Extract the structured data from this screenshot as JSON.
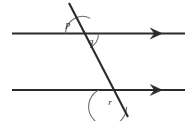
{
  "figure": {
    "background_color": "#ffffff",
    "line_color": "#2b2b2b",
    "arc_color": "#6b6b63",
    "label_color": "#1a1a1a",
    "width": 194,
    "height": 121
  },
  "lines": [
    {
      "name": "upper-parallel-line",
      "x1": 12,
      "y1": 33.5,
      "x2": 185,
      "y2": 33.5,
      "arrow": "right",
      "arrow_x": 162,
      "stroke_width": 2.1
    },
    {
      "name": "lower-parallel-line",
      "x1": 12,
      "y1": 90,
      "x2": 185,
      "y2": 90,
      "arrow": "right",
      "arrow_x": 162,
      "stroke_width": 2.1
    },
    {
      "name": "transversal-line",
      "x1": 69,
      "y1": 3,
      "x2": 128,
      "y2": 117,
      "arrow": "none",
      "stroke_width": 2.1
    }
  ],
  "intersections": [
    {
      "name": "upper-intersection",
      "x": 82.5,
      "y": 33.5
    },
    {
      "name": "lower-intersection",
      "x": 117.7,
      "y": 90
    }
  ],
  "angles": [
    {
      "id": "p",
      "label": "p",
      "name": "angle-p",
      "vertex": "upper-intersection",
      "position": "above-left",
      "label_x": 68,
      "label_y": 27,
      "arc_radius": 17,
      "start_deg": 180,
      "end_deg": 297
    },
    {
      "id": "q",
      "label": "q",
      "name": "angle-q",
      "vertex": "upper-intersection",
      "position": "below-right",
      "label_x": 91,
      "label_y": 44,
      "arc_radius": 16,
      "start_deg": 0,
      "end_deg": 62
    },
    {
      "id": "r",
      "label": "r",
      "name": "angle-r",
      "vertex": "lower-intersection",
      "position": "below-left",
      "label_x": 110,
      "label_y": 105,
      "arc_radius": 19,
      "start_deg": 180,
      "end_deg": 62
    }
  ]
}
